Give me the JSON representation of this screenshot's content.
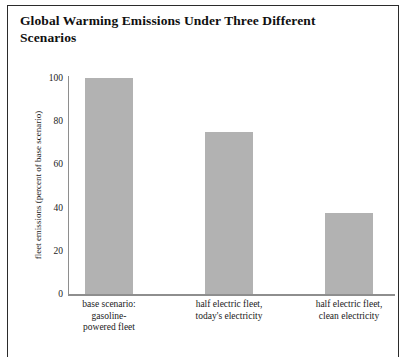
{
  "chart_data": {
    "type": "bar",
    "title": "Global Warming Emissions Under Three Different Scenarios",
    "title_line1": "Global Warming Emissions Under Three Different",
    "title_line2": "Scenarios",
    "xlabel": "",
    "ylabel": "fleet emissions (percent of base scenario)",
    "ylim": [
      0,
      100
    ],
    "yticks": [
      "100",
      "80",
      "60",
      "40",
      "20",
      "0"
    ],
    "ytick_values": [
      100,
      80,
      60,
      40,
      20,
      0
    ],
    "grid": false,
    "legend": "none",
    "bar_color": "#b2b2b2",
    "axis_color": "#8e8e8e",
    "frame_color": "#2b2b2b",
    "categories": [
      "base scenario: gasoline-powered fleet",
      "half electric fleet, today's electricity",
      "half electric fleet, clean electricity"
    ],
    "category_lines": [
      [
        "base scenario:",
        "gasoline-",
        "powered fleet"
      ],
      [
        "half electric fleet,",
        "today's electricity"
      ],
      [
        "half electric fleet,",
        "clean electricity"
      ]
    ],
    "values": [
      100,
      75,
      37.5
    ]
  }
}
